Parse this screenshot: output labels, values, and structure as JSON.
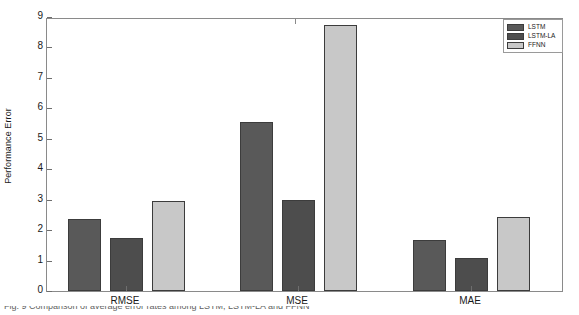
{
  "chart_data": {
    "type": "bar",
    "title": "",
    "subtitle": "",
    "xlabel": "",
    "ylabel": "Performance Error",
    "categories": [
      "RMSE",
      "MSE",
      "MAE"
    ],
    "series": [
      {
        "name": "LSTM",
        "color": "#595959",
        "values": [
          2.35,
          5.55,
          1.68
        ]
      },
      {
        "name": "LSTM-LA",
        "color": "#4d4d4d",
        "values": [
          1.75,
          2.98,
          1.1
        ]
      },
      {
        "name": "FFNN",
        "color": "#c8c8c8",
        "values": [
          2.95,
          8.75,
          2.42
        ]
      }
    ],
    "ylim": [
      0,
      9
    ],
    "yticks": [
      0,
      1,
      2,
      3,
      4,
      5,
      6,
      7,
      8,
      9
    ],
    "ytick_labels": [
      "0",
      "1",
      "2",
      "3",
      "4",
      "5",
      "6",
      "7",
      "8",
      "9"
    ],
    "grid": false,
    "legend_position": "top-right",
    "annotations": []
  },
  "legend": {
    "entries": [
      {
        "label": "LSTM"
      },
      {
        "label": "LSTM-LA"
      },
      {
        "label": "FFNN"
      }
    ]
  },
  "caption": {
    "clipped_text": "Fig. 9 Comparison of average error rates among LSTM, LSTM-LA and FFNN"
  }
}
